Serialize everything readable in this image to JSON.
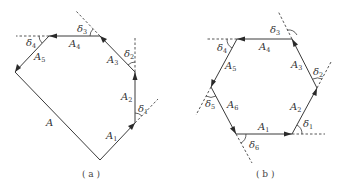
{
  "figure": {
    "panels": [
      {
        "id": "a",
        "caption": "( a )",
        "segments": [
          {
            "label": "A",
            "sub": ""
          },
          {
            "label": "A",
            "sub": "1"
          },
          {
            "label": "A",
            "sub": "2"
          },
          {
            "label": "A",
            "sub": "3"
          },
          {
            "label": "A",
            "sub": "4"
          },
          {
            "label": "A",
            "sub": "5"
          }
        ],
        "angles": [
          {
            "label": "δ",
            "sub": "1"
          },
          {
            "label": "δ",
            "sub": "2"
          },
          {
            "label": "δ",
            "sub": "3"
          },
          {
            "label": "δ",
            "sub": "4"
          }
        ]
      },
      {
        "id": "b",
        "caption": "( b )",
        "segments": [
          {
            "label": "A",
            "sub": "1"
          },
          {
            "label": "A",
            "sub": "2"
          },
          {
            "label": "A",
            "sub": "3"
          },
          {
            "label": "A",
            "sub": "4"
          },
          {
            "label": "A",
            "sub": "5"
          },
          {
            "label": "A",
            "sub": "6"
          }
        ],
        "angles": [
          {
            "label": "δ",
            "sub": "1"
          },
          {
            "label": "δ",
            "sub": "2"
          },
          {
            "label": "δ",
            "sub": "3"
          },
          {
            "label": "δ",
            "sub": "4"
          },
          {
            "label": "δ",
            "sub": "5"
          },
          {
            "label": "δ",
            "sub": "6"
          }
        ]
      }
    ],
    "colors": {
      "line": "#3a3a3a",
      "text": "#333333",
      "background": "#ffffff"
    }
  }
}
